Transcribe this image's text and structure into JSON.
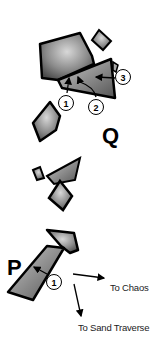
{
  "diagram": {
    "type": "climbing-topo",
    "areas": [
      {
        "label": "Q",
        "routes": [
          "1",
          "2",
          "3"
        ]
      },
      {
        "label": "P",
        "routes": [
          "1"
        ]
      }
    ],
    "directions": [
      {
        "label": "To Chaos"
      },
      {
        "label": "To Sand Traverse"
      }
    ]
  },
  "labels": {
    "q": "Q",
    "p": "P",
    "q_route_1": "1",
    "q_route_2": "2",
    "q_route_3": "3",
    "p_route_1": "1",
    "to_chaos": "To Chaos",
    "to_sand_traverse": "To Sand Traverse"
  }
}
